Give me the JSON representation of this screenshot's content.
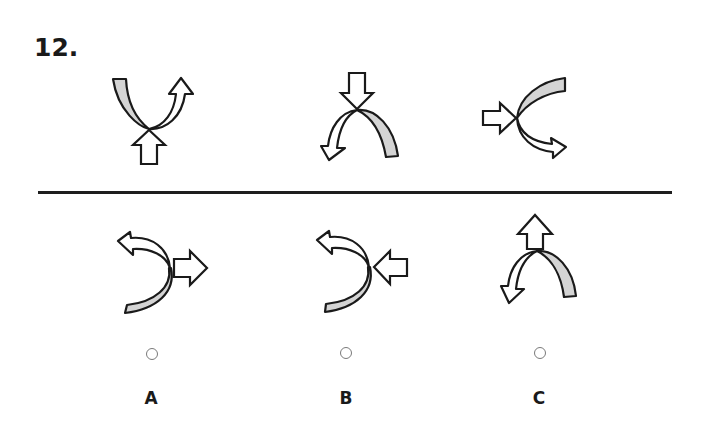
{
  "question": {
    "number": "12."
  },
  "colors": {
    "stroke": "#1a1a1a",
    "band_fill": "#d4d4d4",
    "arrow_fill": "#ffffff",
    "divider": "#1e1e1e",
    "radio_border": "#7a7a7a"
  },
  "sequence": [
    {
      "id": "seq-1",
      "description": "U-shaped curve: gray band on left rising up, white curved arrow on right pointing up-right; straight block arrow pointing up into the crossing point from below"
    },
    {
      "id": "seq-2",
      "description": "Arch-shaped curve: gray band on right descending, white curved arrow on left pointing down-left; straight block arrow pointing down into the crossing point from above"
    },
    {
      "id": "seq-3",
      "description": "C-shaped curve opening right: gray band on top going right, white curved arrow on bottom pointing down-right; straight block arrow pointing right into the crossing point from the left"
    }
  ],
  "options": [
    {
      "label": "A",
      "description": "Reversed-C curve: white curved arrow on top pointing up-left, gray band on bottom; straight block arrow pointing right, away from crossing point"
    },
    {
      "label": "B",
      "description": "Reversed-C curve: white curved arrow on top pointing up-left, gray band on bottom; straight block arrow pointing left into the crossing point from the right"
    },
    {
      "label": "C",
      "description": "Arch-shaped curve: gray band on right, white curved arrow on left pointing down-left; straight block arrow pointing up, away from crossing point"
    }
  ]
}
